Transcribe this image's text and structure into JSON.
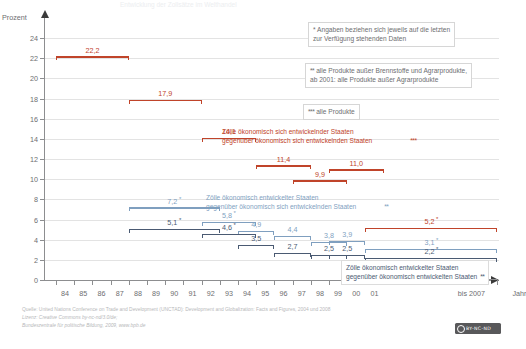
{
  "chart_data": {
    "type": "line",
    "title": "Entwicklung der Zollsätze im Welthandel",
    "ylabel": "Prozent",
    "xlabel": "Jahr",
    "ylim": [
      0,
      25
    ],
    "yticks": [
      0,
      2,
      4,
      6,
      8,
      10,
      12,
      14,
      16,
      18,
      20,
      22,
      24
    ],
    "ytick_labels": [
      "0",
      "2",
      "4",
      "6",
      "8",
      "10",
      "12",
      "14",
      "16",
      "18",
      "20",
      "22",
      "24"
    ],
    "xticks": [
      "84",
      "85",
      "86",
      "87",
      "88",
      "89",
      "90",
      "91",
      "92",
      "93",
      "94",
      "95",
      "96",
      "97",
      "98",
      "99",
      "00",
      "01"
    ],
    "xtick_extra": "bis 2007",
    "grid": true,
    "legend_position": "inline",
    "series": [
      {
        "name": "Zölle ökonomisch sich entwickelnder Staaten gegenüber ökonomisch sich entwickelnden Staaten",
        "color": "#c0442a",
        "marker": "***",
        "segments": [
          {
            "label": "22,2",
            "value": 22.2,
            "x_start": "84",
            "x_end": "87"
          },
          {
            "label": "17,9",
            "value": 17.9,
            "x_start": "88",
            "x_end": "91"
          },
          {
            "label": "14,1",
            "value": 14.1,
            "x_start": "92",
            "x_end": "94"
          },
          {
            "label": "11,4",
            "value": 11.4,
            "x_start": "95",
            "x_end": "97"
          },
          {
            "label": "9,9",
            "value": 9.9,
            "x_start": "97",
            "x_end": "99"
          },
          {
            "label": "11,0",
            "value": 11.0,
            "x_start": "99",
            "x_end": "01"
          }
        ]
      },
      {
        "name": "Zölle ökonomisch entwickelter Staaten gegenüber ökonomisch sich entwickelnden Staaten",
        "color": "#7f9fbf",
        "marker": "**",
        "segments": [
          {
            "label": "7,2",
            "value": 7.2,
            "x_start": "88",
            "x_end": "92",
            "asterisk": "*"
          },
          {
            "label": "5,8",
            "value": 5.8,
            "x_start": "92",
            "x_end": "94",
            "asterisk": "*"
          },
          {
            "label": "4,9",
            "value": 4.9,
            "x_start": "94",
            "x_end": "95"
          },
          {
            "label": "4,4",
            "value": 4.4,
            "x_start": "96",
            "x_end": "97"
          },
          {
            "label": "3,8",
            "value": 3.8,
            "x_start": "98",
            "x_end": "99"
          },
          {
            "label": "3,9",
            "value": 3.9,
            "x_start": "99",
            "x_end": "00"
          },
          {
            "label": "3,1",
            "value": 3.1,
            "x_start": "01",
            "x_end": "bis 2007",
            "asterisk": "*"
          }
        ]
      },
      {
        "name": "Zölle ökonomisch entwickelter Staaten gegenüber ökonomisch entwickelten Staaten",
        "color": "#4a5a72",
        "marker": "**",
        "segments": [
          {
            "label": "5,1",
            "value": 5.1,
            "x_start": "88",
            "x_end": "92",
            "asterisk": "*"
          },
          {
            "label": "4,6",
            "value": 4.6,
            "x_start": "92",
            "x_end": "94",
            "asterisk": "*"
          },
          {
            "label": "3,5",
            "value": 3.5,
            "x_start": "94",
            "x_end": "95"
          },
          {
            "label": "2,7",
            "value": 2.7,
            "x_start": "96",
            "x_end": "97"
          },
          {
            "label": "2,5",
            "value": 2.5,
            "x_start": "98",
            "x_end": "99"
          },
          {
            "label": "2,5",
            "value": 2.5,
            "x_start": "99",
            "x_end": "00"
          },
          {
            "label": "2,2",
            "value": 2.2,
            "x_start": "01",
            "x_end": "bis 2007",
            "asterisk": "*"
          }
        ]
      },
      {
        "name": "rote Linie rechts",
        "color": "#c0442a",
        "segments": [
          {
            "label": "5,2",
            "value": 5.2,
            "x_start": "01",
            "x_end": "bis 2007",
            "asterisk": "*"
          }
        ]
      }
    ]
  },
  "notes": [
    {
      "marker": "*",
      "lines": [
        "Angaben beziehen sich jeweils auf die letzten",
        "zur Verfügung stehenden Daten"
      ]
    },
    {
      "marker": "**",
      "lines": [
        "alle Produkte außer Brennstoffe und Agrarprodukte,",
        "ab 2001: alle Produkte außer Agrarprodukte"
      ]
    },
    {
      "marker": "***",
      "lines": [
        "alle Produkte"
      ]
    }
  ],
  "series_labels": [
    {
      "marker": "***",
      "color": "red",
      "lines": [
        "Zölle ökonomisch sich entwickelnder Staaten",
        "gegenüber ökonomisch sich entwickelnden Staaten"
      ]
    },
    {
      "marker": "**",
      "color": "blue",
      "lines": [
        "Zölle ökonomisch entwickelter Staaten",
        "gegenüber ökonomisch sich entwickelnden Staaten"
      ]
    },
    {
      "marker": "**",
      "color": "navy",
      "lines": [
        "Zölle ökonomisch entwickelter Staaten",
        "gegenüber ökonomisch entwickelten Staaten"
      ]
    }
  ],
  "footer": {
    "line1": "Quelle: United Nations Conference on Trade and Development (UNCTAD): Development and Globalization: Facts and Figures, 2004 und 2008",
    "line2": "Lizenz: Creative Commons by-nc-nd/3.0/de;",
    "line3": "Bundeszentrale für politische Bildung, 2009, www.bpb.de"
  },
  "cc_badge": {
    "text": "BY-NC-ND"
  }
}
